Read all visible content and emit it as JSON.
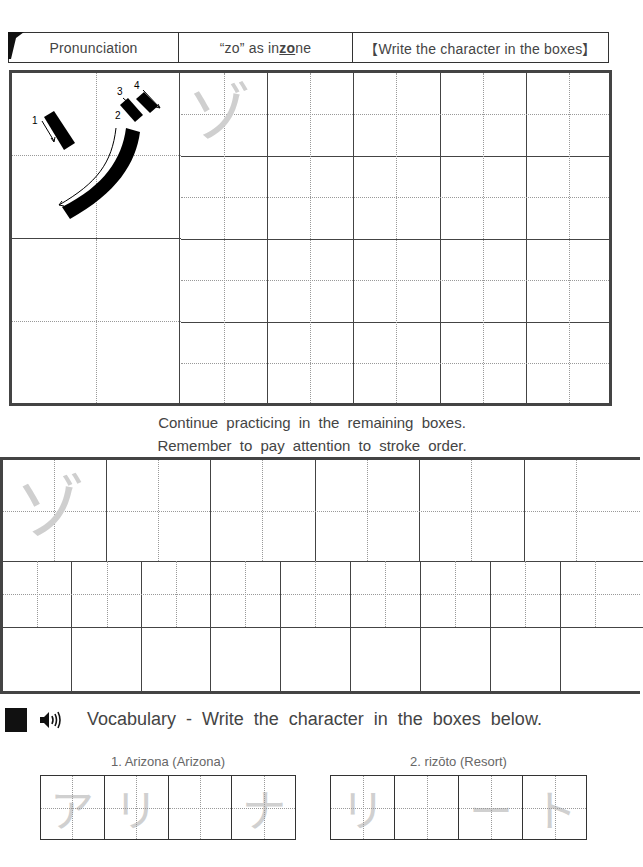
{
  "header": {
    "col1": "Pronunciation",
    "col2_prefix": "“zo” as in ",
    "col2_underlined": "zo",
    "col2_suffix": "ne",
    "col3": "【Write the character in the boxes】"
  },
  "character": {
    "kana": "ゾ",
    "romaji": "zo",
    "stroke_numbers": [
      "1",
      "2",
      "3",
      "4"
    ]
  },
  "instructions": {
    "line1": "Continue practicing in the remaining boxes.",
    "line2": "Remember to pay attention to stroke order."
  },
  "vocabulary": {
    "title": "Vocabulary - Write the character in the boxes below.",
    "icons": [
      "black-square-icon",
      "speaker-icon"
    ],
    "words": [
      {
        "label": "1. Arizona (Arizona)",
        "cells": [
          "ア",
          "リ",
          "",
          "ナ"
        ]
      },
      {
        "label": "2. rizōto (Resort)",
        "cells": [
          "リ",
          "",
          "ー",
          "ト"
        ]
      }
    ]
  },
  "colors": {
    "border": "#444444",
    "guide_gray": "#cfcfcf",
    "text": "#444444"
  }
}
